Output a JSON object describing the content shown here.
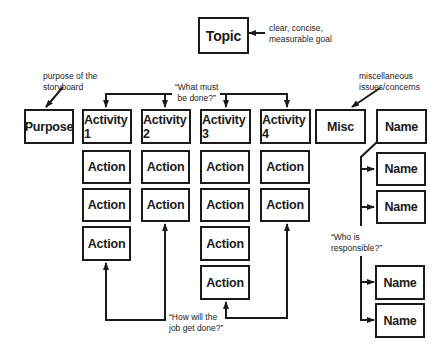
{
  "topic": {
    "label": "Topic",
    "note_line1": "clear, concise,",
    "note_line2": "measurable goal"
  },
  "purpose": {
    "label": "Purpose",
    "note_line1": "purpose of the",
    "note_line2": "storyboard"
  },
  "activities_note": {
    "line1": "“What must",
    "line2": "be done?”"
  },
  "activities": [
    {
      "label": "Activity 1",
      "actions": [
        "Action",
        "Action",
        "Action"
      ]
    },
    {
      "label": "Activity 2",
      "actions": [
        "Action",
        "Action"
      ]
    },
    {
      "label": "Activity 3",
      "actions": [
        "Action",
        "Action",
        "Action",
        "Action"
      ]
    },
    {
      "label": "Activity 4",
      "actions": [
        "Action",
        "Action"
      ]
    }
  ],
  "actions_note": {
    "line1": "“How will the",
    "line2": "job get done?”"
  },
  "misc": {
    "label": "Misc",
    "note_line1": "miscellaneous",
    "note_line2": "issues/concerns"
  },
  "names": [
    "Name",
    "Name",
    "Name",
    "Name",
    "Name"
  ],
  "names_note": {
    "line1": "“Who is",
    "line2": "responsible?”"
  },
  "colors": {
    "line": "#1a1a1a",
    "background": "#ffffff"
  }
}
